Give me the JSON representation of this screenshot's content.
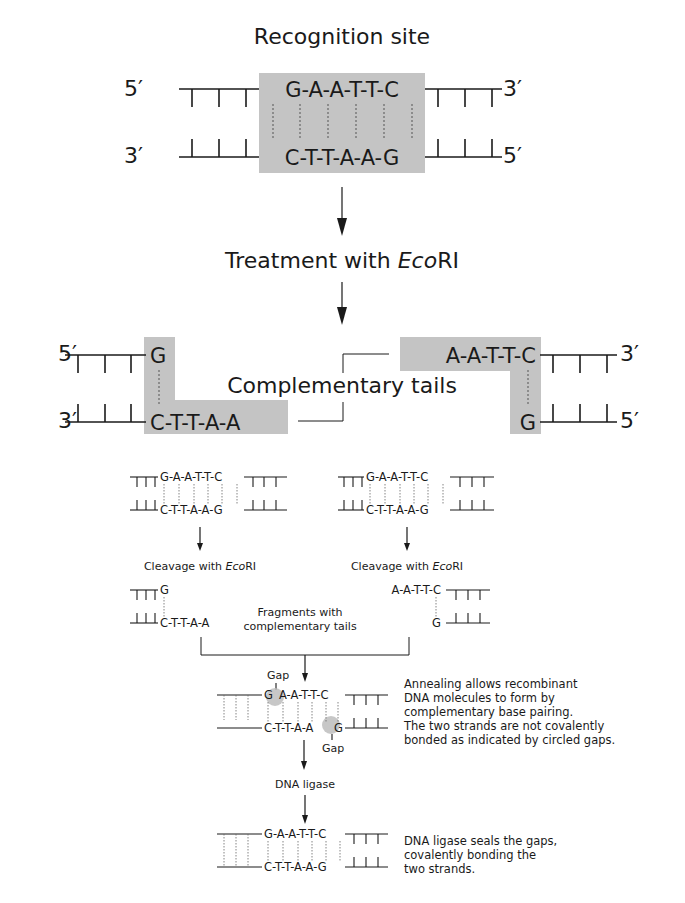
{
  "figure": {
    "top": {
      "title": "Recognition site",
      "left_top_label": "5′",
      "left_bottom_label": "3′",
      "right_top_label": "3′",
      "right_bottom_label": "5′",
      "top_strand": "G-A-A-T-T-C",
      "bottom_strand": "C-T-T-A-A-G"
    },
    "treatment_label_prefix": "Treatment with ",
    "treatment_label_enzyme": "Eco",
    "treatment_label_suffix": "RI",
    "cut": {
      "left_fragment": {
        "top_label": "5′",
        "bottom_label": "3′",
        "top_seq": "G",
        "bottom_seq": "C-T-T-A-A"
      },
      "right_fragment": {
        "top_label": "3′",
        "bottom_label": "5′",
        "top_seq": "A-A-T-T-C",
        "bottom_seq": "G"
      },
      "center_label": "Complementary tails"
    },
    "lower": {
      "left_molecule": {
        "top_seq": "G-A-A-T-T-C",
        "bottom_seq": "C-T-T-A-A-G"
      },
      "right_molecule": {
        "top_seq": "G-A-A-T-T-C",
        "bottom_seq": "C-T-T-A-A-G"
      },
      "cleavage_prefix": "Cleavage with ",
      "cleavage_enzyme": "Eco",
      "cleavage_suffix": "RI",
      "left_fragment": {
        "top_seq": "G",
        "bottom_seq": "C-T-T-A-A"
      },
      "right_fragment": {
        "top_seq": "A-A-T-T-C",
        "bottom_seq": "G"
      },
      "fragments_label_line1": "Fragments with",
      "fragments_label_line2": "complementary tails",
      "annealed": {
        "gap_top_label": "Gap",
        "gap_bottom_label": "Gap",
        "top_seq_first": "G",
        "top_seq_rest": "A-A-T-T-C",
        "bottom_seq_main": "C-T-T-A-A",
        "bottom_seq_last": "G",
        "note_lines": [
          "Annealing allows recombinant",
          "DNA molecules to form by",
          "complementary base pairing.",
          "The two strands are not covalently",
          "bonded as indicated by circled gaps."
        ]
      },
      "ligase_label": "DNA ligase",
      "ligated": {
        "top_seq": "G-A-A-T-T-C",
        "bottom_seq": "C-T-T-A-A-G",
        "note_lines": [
          "DNA ligase seals the gaps,",
          "covalently bonding the",
          "two strands."
        ]
      }
    },
    "colors": {
      "shade": "#c4c4c4",
      "ink": "#1a1a1a",
      "gap_circle": "#bdbdbd"
    }
  }
}
